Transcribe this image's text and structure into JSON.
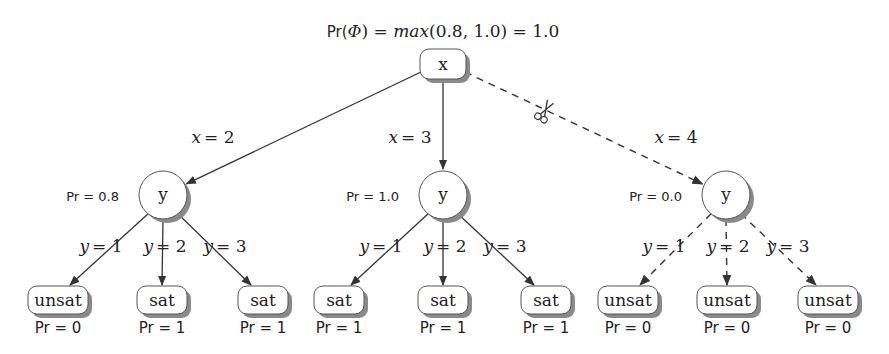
{
  "diagram": {
    "title": "Pr(Φ) = max(0.8, 1.0) = 1.0",
    "title_parts": {
      "pr": "Pr(",
      "phi": "Φ",
      "eq1": ") = ",
      "max": "max",
      "args": "(0.8, 1.0) = 1.0"
    },
    "root": {
      "label": "x",
      "x": 443,
      "y": 64
    },
    "colors": {
      "stroke": "#333333",
      "shadow": "#8a8a8a",
      "fill": "#ffffff",
      "text": "#222222"
    },
    "branches": [
      {
        "edge_label": "x = 2",
        "edge_var": "x",
        "edge_val": "= 2",
        "pruned": false,
        "node": {
          "label": "y",
          "x": 163,
          "y": 195,
          "pr": "Pr = 0.8"
        },
        "children": [
          {
            "edge_var": "y",
            "edge_val": "= 1",
            "label": "unsat",
            "pr": "Pr = 0",
            "x": 58,
            "y": 300
          },
          {
            "edge_var": "y",
            "edge_val": "= 2",
            "label": "sat",
            "pr": "Pr = 1",
            "x": 162,
            "y": 300
          },
          {
            "edge_var": "y",
            "edge_val": "= 3",
            "label": "sat",
            "pr": "Pr = 1",
            "x": 263,
            "y": 300
          }
        ]
      },
      {
        "edge_label": "x = 3",
        "edge_var": "x",
        "edge_val": "= 3",
        "pruned": false,
        "node": {
          "label": "y",
          "x": 443,
          "y": 195,
          "pr": "Pr = 1.0"
        },
        "children": [
          {
            "edge_var": "y",
            "edge_val": "= 1",
            "label": "sat",
            "pr": "Pr = 1",
            "x": 339,
            "y": 300
          },
          {
            "edge_var": "y",
            "edge_val": "= 2",
            "label": "sat",
            "pr": "Pr = 1",
            "x": 443,
            "y": 300
          },
          {
            "edge_var": "y",
            "edge_val": "= 3",
            "label": "sat",
            "pr": "Pr = 1",
            "x": 546,
            "y": 300
          }
        ]
      },
      {
        "edge_label": "x = 4",
        "edge_var": "x",
        "edge_val": "= 4",
        "pruned": true,
        "cut_icon": "scissors-icon",
        "node": {
          "label": "y",
          "x": 726,
          "y": 195,
          "pr": "Pr = 0.0"
        },
        "children": [
          {
            "edge_var": "y",
            "edge_val": "= 1",
            "label": "unsat",
            "pr": "Pr = 0",
            "x": 628,
            "y": 300
          },
          {
            "edge_var": "y",
            "edge_val": "= 2",
            "label": "unsat",
            "pr": "Pr = 0",
            "x": 727,
            "y": 300
          },
          {
            "edge_var": "y",
            "edge_val": "= 3",
            "label": "unsat",
            "pr": "Pr = 0",
            "x": 828,
            "y": 300
          }
        ]
      }
    ]
  }
}
